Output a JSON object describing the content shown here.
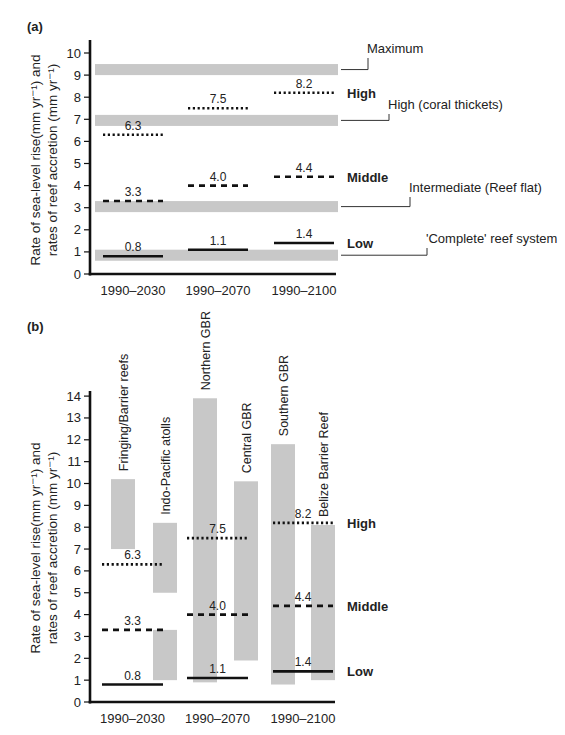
{
  "figure": {
    "panel_a_label": "(a)",
    "panel_b_label": "(b)",
    "ylabel_line1": "Rate of sea-level rise(mm yr⁻¹) and",
    "ylabel_line2": "rates of reef accretion (mm yr⁻¹)",
    "colors": {
      "band": "#c8c8c8",
      "axis": "#111111",
      "line": "#111111"
    }
  },
  "chart_data": [
    {
      "type": "bar",
      "panel": "(a)",
      "title": "",
      "xlabel": "",
      "ylabel": "Rate of sea-level rise(mm yr⁻¹) and rates of reef accretion (mm yr⁻¹)",
      "ylim": [
        0,
        10
      ],
      "yticks": [
        0,
        1,
        2,
        3,
        4,
        5,
        6,
        7,
        8,
        9,
        10
      ],
      "categories": [
        "1990–2030",
        "1990–2070",
        "1990–2100"
      ],
      "series": [
        {
          "name": "High",
          "style": "dotted",
          "values": [
            6.3,
            7.5,
            8.2
          ]
        },
        {
          "name": "Middle",
          "style": "dashed",
          "values": [
            3.3,
            4.0,
            4.4
          ]
        },
        {
          "name": "Low",
          "style": "solid",
          "values": [
            0.8,
            1.1,
            1.4
          ]
        }
      ],
      "bands": [
        {
          "label": "Maximum",
          "low": 9.0,
          "high": 9.5
        },
        {
          "label": "High (coral thickets)",
          "low": 6.7,
          "high": 7.2
        },
        {
          "label": "Intermediate (Reef flat)",
          "low": 2.8,
          "high": 3.3
        },
        {
          "label": "'Complete' reef system",
          "low": 0.6,
          "high": 1.1
        }
      ],
      "scenario_labels": [
        "High",
        "Middle",
        "Low"
      ]
    },
    {
      "type": "bar",
      "panel": "(b)",
      "title": "",
      "xlabel": "",
      "ylabel": "Rate of sea-level rise(mm yr⁻¹) and rates of reef accretion (mm yr⁻¹)",
      "ylim": [
        0,
        14
      ],
      "yticks": [
        0,
        1,
        2,
        3,
        4,
        5,
        6,
        7,
        8,
        9,
        10,
        11,
        12,
        13,
        14
      ],
      "categories": [
        "1990–2030",
        "1990–2070",
        "1990–2100"
      ],
      "series": [
        {
          "name": "High",
          "style": "dotted",
          "values": [
            6.3,
            7.5,
            8.2
          ]
        },
        {
          "name": "Middle",
          "style": "dashed",
          "values": [
            3.3,
            4.0,
            4.4
          ]
        },
        {
          "name": "Low",
          "style": "solid",
          "values": [
            0.8,
            1.1,
            1.4
          ]
        }
      ],
      "ranges": [
        {
          "label": "Fringing/Barrier reefs",
          "low": 7.0,
          "high": 10.2
        },
        {
          "label": "Indo-Pacific atolls",
          "segments": [
            [
              5.0,
              8.2
            ],
            [
              1.0,
              3.3
            ]
          ]
        },
        {
          "label": "Northern GBR",
          "low": 0.9,
          "high": 13.9
        },
        {
          "label": "Central GBR",
          "low": 1.9,
          "high": 10.1
        },
        {
          "label": "Southern GBR",
          "low": 0.8,
          "high": 11.8
        },
        {
          "label": "Belize Barrier Reef",
          "low": 1.0,
          "high": 8.1
        }
      ],
      "scenario_labels": [
        "High",
        "Middle",
        "Low"
      ]
    }
  ]
}
